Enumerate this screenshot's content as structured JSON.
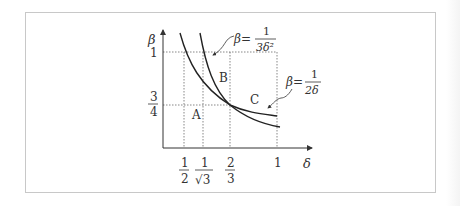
{
  "figure": {
    "axes": {
      "x_label": "δ",
      "y_label": "β",
      "x_ticks": [
        {
          "num": "1",
          "den": "2",
          "value": 0.5
        },
        {
          "num": "1",
          "den": "√3",
          "value": 0.5774
        },
        {
          "num": "2",
          "den": "3",
          "value": 0.6667
        },
        {
          "num": "1",
          "den": "",
          "value": 1
        }
      ],
      "y_ticks": [
        {
          "num": "1",
          "den": "",
          "value": 1
        },
        {
          "num": "3",
          "den": "4",
          "value": 0.75
        }
      ]
    },
    "curves": [
      {
        "name": "curve-1-over-3delta-squared",
        "label_prefix": "β=",
        "label_num": "1",
        "label_den": "3δ²"
      },
      {
        "name": "curve-1-over-2delta",
        "label_prefix": "β=",
        "label_num": "1",
        "label_den": "2δ"
      }
    ],
    "regions": {
      "a": "A",
      "b": "B",
      "c": "C"
    }
  }
}
